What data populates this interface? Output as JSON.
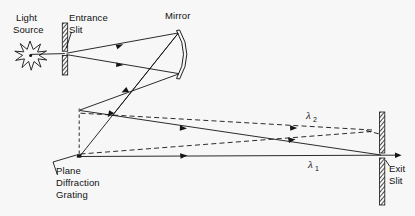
{
  "figure": {
    "background_color": "#f7f7f7",
    "ink_color": "#141414"
  },
  "labels": {
    "light_source_line1": "Light",
    "light_source_line2": "Source",
    "entrance_slit_line1": "Entrance",
    "entrance_slit_line2": "Slit",
    "mirror": "Mirror",
    "grating_line1": "Plane",
    "grating_line2": "Diffraction",
    "grating_line3": "Grating",
    "exit_slit_line1": "Exit",
    "exit_slit_line2": "Slit",
    "lambda": "λ",
    "lambda1_sub": "1",
    "lambda2_sub": "2"
  },
  "components": {
    "light_source": {
      "name": "starburst-source",
      "x": 30,
      "y": 55
    },
    "entrance_slit": {
      "name": "hatched-bar",
      "x": 65,
      "top": 23,
      "bottom": 75,
      "gap_y": 53
    },
    "mirror": {
      "name": "concave-arc",
      "x": 180,
      "top": 30,
      "bottom": 78
    },
    "grating": {
      "name": "dashed-vertical-line",
      "x": 79,
      "top": 110,
      "bottom": 157
    },
    "exit_slit": {
      "name": "hatched-bar-pair",
      "x": 382,
      "top": 112,
      "bottom": 205,
      "gap_y": 155
    }
  },
  "rays": {
    "incoming_solid_count": 2,
    "reflected_solid_count": 2,
    "diffracted_solid_count": 2,
    "diffracted_dashed_count": 2,
    "lambda1_label": "λ1",
    "lambda2_label": "λ2"
  }
}
